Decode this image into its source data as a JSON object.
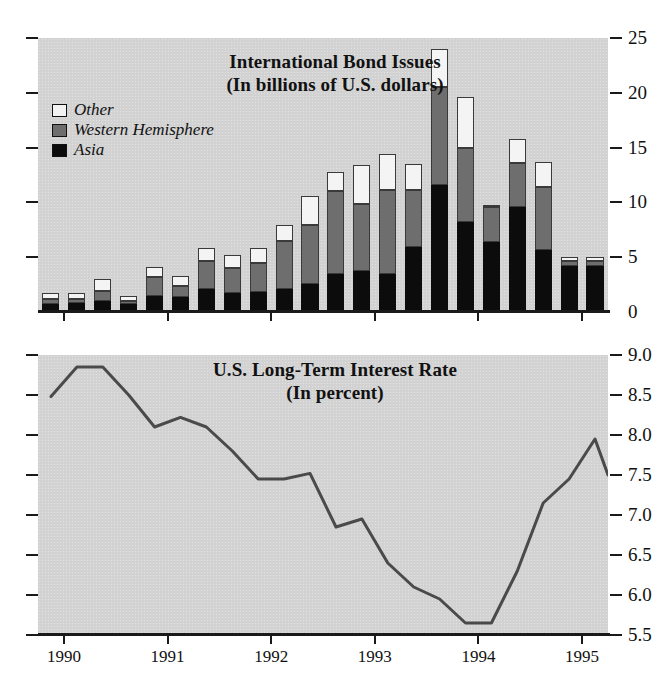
{
  "figure": {
    "background": "#d2d2d2",
    "ink": "#111111"
  },
  "panel_top": {
    "title_line1": "International Bond Issues",
    "title_line2": "(In billions of U.S. dollars)",
    "legend": [
      {
        "label": "Other",
        "color": "#f4f4f4",
        "key": "other"
      },
      {
        "label": "Western Hemisphere",
        "color": "#6e6e6e",
        "key": "western_hemisphere"
      },
      {
        "label": "Asia",
        "color": "#0c0c0c",
        "key": "asia"
      }
    ],
    "ytick_labels": [
      "25",
      "20",
      "15",
      "10",
      "5",
      "0"
    ],
    "xtick_labels": [
      "1990",
      "1991",
      "1992",
      "1993",
      "1994",
      "1995"
    ]
  },
  "panel_bottom": {
    "title_line1": "U.S. Long-Term Interest Rate",
    "title_line2": "(In percent)",
    "ytick_labels": [
      "9.0",
      "8.5",
      "8.0",
      "7.5",
      "7.0",
      "6.5",
      "6.0",
      "5.5"
    ],
    "xtick_labels": [
      "1990",
      "1991",
      "1992",
      "1993",
      "1994",
      "1995"
    ]
  },
  "chart_data": [
    {
      "type": "bar",
      "stacked": true,
      "title": "International Bond Issues",
      "subtitle": "(In billions of U.S. dollars)",
      "xlabel": "",
      "ylabel": "In billions of U.S. dollars",
      "ylim": [
        0,
        25
      ],
      "yticks": [
        0,
        5,
        10,
        15,
        20,
        25
      ],
      "grid": false,
      "legend_position": "upper-left",
      "categories": [
        "1989Q4",
        "1990Q1",
        "1990Q2",
        "1990Q3",
        "1990Q4",
        "1991Q1",
        "1991Q2",
        "1991Q3",
        "1991Q4",
        "1992Q1",
        "1992Q2",
        "1992Q3",
        "1992Q4",
        "1993Q1",
        "1993Q2",
        "1993Q3",
        "1993Q4",
        "1994Q1",
        "1994Q2",
        "1994Q3",
        "1994Q4",
        "1995Q1"
      ],
      "year_tick_categories": [
        "1990",
        "1991",
        "1992",
        "1993",
        "1994",
        "1995"
      ],
      "series": [
        {
          "name": "Asia",
          "color": "#0c0c0c",
          "values": [
            0.7,
            0.8,
            1.0,
            0.7,
            1.5,
            1.4,
            2.1,
            1.7,
            1.8,
            2.1,
            2.6,
            3.5,
            3.7,
            3.5,
            5.9,
            11.6,
            8.2,
            6.4,
            9.6,
            5.7,
            4.2,
            4.2
          ]
        },
        {
          "name": "Western Hemisphere",
          "color": "#6e6e6e",
          "values": [
            0.5,
            0.4,
            0.9,
            0.3,
            1.7,
            1.0,
            2.6,
            2.3,
            2.7,
            4.4,
            5.3,
            7.5,
            6.2,
            7.6,
            5.2,
            8.9,
            6.8,
            3.2,
            4.0,
            5.7,
            0.5,
            0.5
          ]
        },
        {
          "name": "Other",
          "color": "#f4f4f4",
          "values": [
            0.5,
            0.5,
            1.1,
            0.5,
            0.9,
            0.9,
            1.1,
            1.2,
            1.3,
            1.4,
            2.7,
            1.8,
            3.5,
            3.3,
            2.4,
            3.5,
            4.6,
            0.2,
            2.2,
            2.3,
            0.3,
            0.3
          ]
        }
      ],
      "totals": [
        1.7,
        1.7,
        3.0,
        1.5,
        4.1,
        3.3,
        5.8,
        5.2,
        5.8,
        7.9,
        10.6,
        12.8,
        13.4,
        14.4,
        13.5,
        24.0,
        19.6,
        9.8,
        15.8,
        13.7,
        5.0,
        5.0
      ]
    },
    {
      "type": "line",
      "title": "U.S. Long-Term Interest Rate",
      "subtitle": "(In percent)",
      "xlabel": "",
      "ylabel": "In percent",
      "ylim": [
        5.5,
        9.0
      ],
      "yticks": [
        5.5,
        6.0,
        6.5,
        7.0,
        7.5,
        8.0,
        8.5,
        9.0
      ],
      "grid": false,
      "legend_position": "none",
      "line_color": "#4a4a4a",
      "x": [
        "1989Q4",
        "1990Q1",
        "1990Q2",
        "1990Q3",
        "1990Q4",
        "1991Q1",
        "1991Q2",
        "1991Q3",
        "1991Q4",
        "1992Q1",
        "1992Q2",
        "1992Q3",
        "1992Q4",
        "1993Q1",
        "1993Q2",
        "1993Q3",
        "1993Q4",
        "1994Q1",
        "1994Q2",
        "1994Q3",
        "1994Q4",
        "1995Q1"
      ],
      "values": [
        8.48,
        8.85,
        8.85,
        8.5,
        8.1,
        8.22,
        8.1,
        7.8,
        7.45,
        7.45,
        7.52,
        6.85,
        6.95,
        6.4,
        6.1,
        5.95,
        5.65,
        5.65,
        6.3,
        7.15,
        7.45,
        7.95,
        7.5
      ]
    }
  ]
}
